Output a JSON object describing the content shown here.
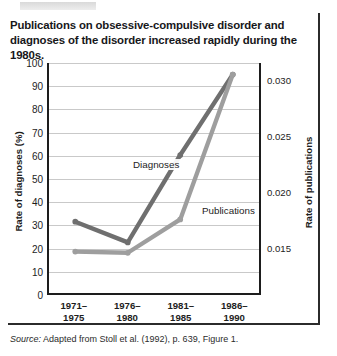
{
  "title": "Publications on obsessive-compulsive disorder and diagnoses of the disorder increased rapidly during the 1980s.",
  "source": {
    "label": "Source:",
    "text": "Adapted from Stoll et al. (1992), p. 639, Figure 1."
  },
  "colors": {
    "diagnoses_line": "#6f6f6f",
    "publications_line": "#9e9e9e",
    "axis": "#1d1d1d",
    "gridline": "#c9c9c9",
    "frame": "#2b2b2b"
  },
  "chart_data": {
    "type": "line",
    "title": "Publications on obsessive-compulsive disorder and diagnoses of the disorder increased rapidly during the 1980s.",
    "categories": [
      "1971–\n1975",
      "1976–\n1980",
      "1981–\n1985",
      "1986–\n1990"
    ],
    "category_lines": [
      [
        "1971–",
        "1975"
      ],
      [
        "1976–",
        "1980"
      ],
      [
        "1981–",
        "1985"
      ],
      [
        "1986–",
        "1990"
      ]
    ],
    "xlabel": "",
    "ylabel": "Rate of diagnoses (%)",
    "y2label": "Rate of publications",
    "ylim": [
      0,
      100
    ],
    "yticks": [
      0,
      10,
      20,
      30,
      40,
      50,
      60,
      70,
      80,
      90,
      100
    ],
    "ytick_labels": [
      "0",
      "10",
      "20",
      "30",
      "40",
      "50",
      "60",
      "70",
      "80",
      "90",
      "100"
    ],
    "y2lim": [
      0.0108,
      0.0315
    ],
    "y2ticks": [
      0.015,
      0.02,
      0.025,
      0.03
    ],
    "y2tick_labels": [
      "0.015",
      "0.020",
      "0.025",
      "0.030"
    ],
    "grid": true,
    "legend": "inline-annotations",
    "series": [
      {
        "name": "Diagnoses",
        "axis": "left",
        "color": "#6f6f6f",
        "values": [
          31,
          22,
          60,
          95
        ],
        "unit": "%"
      },
      {
        "name": "Publications",
        "axis": "right",
        "color": "#9e9e9e",
        "values": [
          0.0143,
          0.0141,
          0.0185,
          0.031
        ],
        "left_axis_equivalent": [
          18,
          17.5,
          32,
          95
        ],
        "unit": "rate"
      }
    ],
    "annotations": [
      {
        "text": "Diagnoses",
        "series": "Diagnoses"
      },
      {
        "text": "Publications",
        "series": "Publications"
      }
    ]
  }
}
